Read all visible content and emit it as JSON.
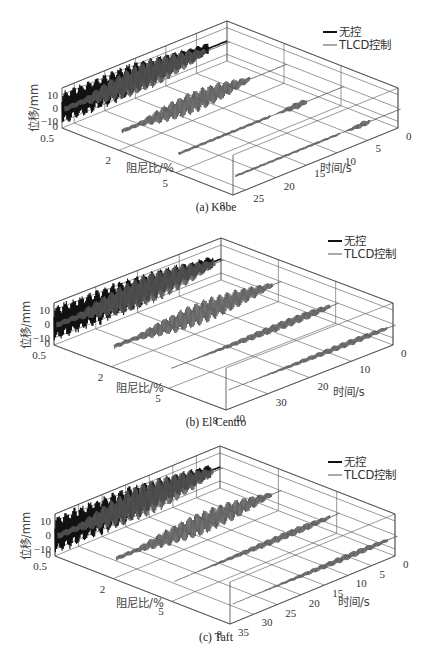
{
  "chart_data": [
    {
      "type": "line",
      "subtype": "3d-waterfall",
      "caption": "(a) Kobe",
      "zlabel": "位移/mm",
      "xlabel": "阻尼比/%",
      "ylabel": "时间/s",
      "z_ticks": [
        "10",
        "0",
        "−10",
        "0"
      ],
      "x_ticks": [
        "0.5",
        "2",
        "5",
        "8"
      ],
      "y_ticks": [
        "0",
        "5",
        "10",
        "15",
        "20",
        "25"
      ],
      "damping_ratios": [
        0.5,
        2,
        5,
        8
      ],
      "time_range": [
        0,
        27
      ],
      "z_range": [
        -15,
        15
      ],
      "legend": [
        "无控",
        "TLCD控制"
      ],
      "series": [
        {
          "name": "无控",
          "damping": 0.5,
          "peak_amplitude_mm": 14,
          "active_window_s": [
            3,
            27
          ]
        },
        {
          "name": "TLCD控制",
          "damping": 0.5,
          "peak_amplitude_mm": 12,
          "active_window_s": [
            4,
            27
          ]
        },
        {
          "name": "TLCD控制",
          "damping": 2,
          "peak_amplitude_mm": 9,
          "active_window_s": [
            6,
            27
          ]
        },
        {
          "name": "TLCD控制",
          "damping": 5,
          "peak_amplitude_mm": 6,
          "active_window_s": [
            6,
            12
          ]
        },
        {
          "name": "TLCD控制",
          "damping": 8,
          "peak_amplitude_mm": 5,
          "active_window_s": [
            5,
            10
          ]
        }
      ]
    },
    {
      "type": "line",
      "subtype": "3d-waterfall",
      "caption": "(b) El Centro",
      "zlabel": "位移/mm",
      "xlabel": "阻尼比/%",
      "ylabel": "时间/s",
      "z_ticks": [
        "10",
        "0",
        "−10",
        "0"
      ],
      "x_ticks": [
        "0.5",
        "2",
        "5",
        "8"
      ],
      "y_ticks": [
        "0",
        "10",
        "20",
        "30",
        "40"
      ],
      "damping_ratios": [
        0.5,
        2,
        5,
        8
      ],
      "time_range": [
        0,
        40
      ],
      "z_range": [
        -15,
        15
      ],
      "legend": [
        "无控",
        "TLCD控制"
      ],
      "series": [
        {
          "name": "无控",
          "damping": 0.5,
          "peak_amplitude_mm": 14,
          "active_window_s": [
            2,
            40
          ]
        },
        {
          "name": "TLCD控制",
          "damping": 0.5,
          "peak_amplitude_mm": 12,
          "active_window_s": [
            2,
            40
          ]
        },
        {
          "name": "TLCD控制",
          "damping": 2,
          "peak_amplitude_mm": 9,
          "active_window_s": [
            2,
            40
          ]
        },
        {
          "name": "TLCD控制",
          "damping": 5,
          "peak_amplitude_mm": 7,
          "active_window_s": [
            2,
            40
          ]
        },
        {
          "name": "TLCD控制",
          "damping": 8,
          "peak_amplitude_mm": 5,
          "active_window_s": [
            2,
            40
          ]
        }
      ]
    },
    {
      "type": "line",
      "subtype": "3d-waterfall",
      "caption": "(c) Taft",
      "zlabel": "位移/mm",
      "xlabel": "阻尼比/%",
      "ylabel": "时间/s",
      "z_ticks": [
        "10",
        "0",
        "−10",
        "0"
      ],
      "x_ticks": [
        "0.5",
        "2",
        "5",
        "8"
      ],
      "y_ticks": [
        "0",
        "5",
        "10",
        "15",
        "20",
        "25",
        "30",
        "35"
      ],
      "damping_ratios": [
        0.5,
        2,
        5,
        8
      ],
      "time_range": [
        0,
        35
      ],
      "z_range": [
        -15,
        15
      ],
      "legend": [
        "无控",
        "TLCD控制"
      ],
      "series": [
        {
          "name": "无控",
          "damping": 0.5,
          "peak_amplitude_mm": 15,
          "active_window_s": [
            2,
            35
          ]
        },
        {
          "name": "TLCD控制",
          "damping": 0.5,
          "peak_amplitude_mm": 13,
          "active_window_s": [
            2,
            35
          ]
        },
        {
          "name": "TLCD控制",
          "damping": 2,
          "peak_amplitude_mm": 9,
          "active_window_s": [
            2,
            35
          ]
        },
        {
          "name": "TLCD控制",
          "damping": 5,
          "peak_amplitude_mm": 6,
          "active_window_s": [
            2,
            35
          ]
        },
        {
          "name": "TLCD控制",
          "damping": 8,
          "peak_amplitude_mm": 5,
          "active_window_s": [
            2,
            35
          ]
        }
      ]
    }
  ],
  "colors": {
    "uncontrolled": "#111111",
    "controlled": "#555555",
    "grid": "#555555"
  }
}
